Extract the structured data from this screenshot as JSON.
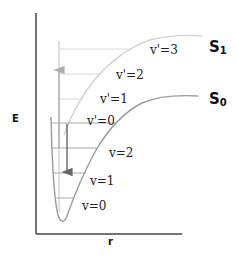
{
  "diagram": {
    "axes": {
      "y_label": "E",
      "x_label": "r"
    },
    "states": [
      {
        "name": "S",
        "subscript": "1",
        "color": "#c8c8c8",
        "levels": [
          "v'=0",
          "v'=1",
          "v'=2",
          "v'=3"
        ]
      },
      {
        "name": "S",
        "subscript": "0",
        "color": "#8c8c8c",
        "levels": [
          "v=0",
          "v=1",
          "v=2"
        ]
      }
    ],
    "arrows": [
      {
        "name": "absorption",
        "direction": "up",
        "color": "#b0b0b0"
      },
      {
        "name": "emission",
        "direction": "down",
        "color": "#666666"
      }
    ]
  }
}
